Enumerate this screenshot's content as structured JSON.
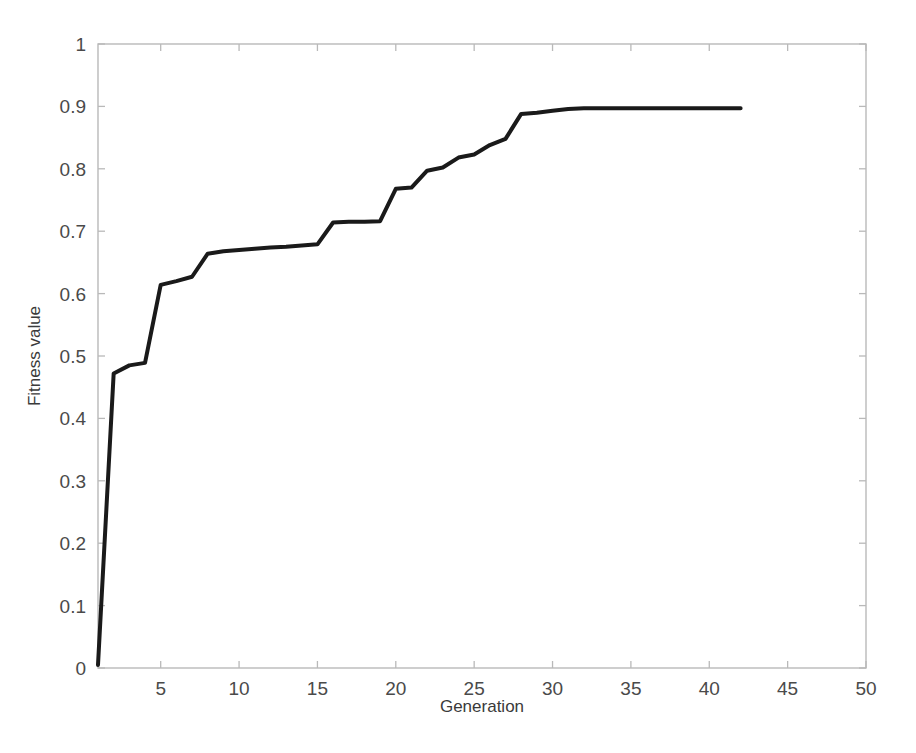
{
  "figure": {
    "background_color": "#ffffff",
    "line_color": "#1a1a1a",
    "axis_color": "#b9b9b9",
    "text_color": "#4a4a4a"
  },
  "chart_data": {
    "type": "line",
    "title": "",
    "subtitle": "",
    "xlabel": "Generation",
    "ylabel": "Fitness value",
    "xlim": [
      1,
      50
    ],
    "ylim": [
      0,
      1
    ],
    "grid": false,
    "legend": null,
    "x_ticks": [
      5,
      10,
      15,
      20,
      25,
      30,
      35,
      40,
      45,
      50
    ],
    "x_tick_labels": [
      "5",
      "10",
      "15",
      "20",
      "25",
      "30",
      "35",
      "40",
      "45",
      "50"
    ],
    "y_ticks": [
      0,
      0.1,
      0.2,
      0.3,
      0.4,
      0.5,
      0.6,
      0.7,
      0.8,
      0.9,
      1
    ],
    "y_tick_labels": [
      "0",
      "0.1",
      "0.2",
      "0.3",
      "0.4",
      "0.5",
      "0.6",
      "0.7",
      "0.8",
      "0.9",
      "1"
    ],
    "series": [
      {
        "name": "Best fitness",
        "line_width": 4,
        "color": "#1a1a1a",
        "x": [
          1,
          2,
          3,
          4,
          5,
          6,
          7,
          8,
          9,
          10,
          11,
          12,
          13,
          14,
          15,
          16,
          17,
          18,
          19,
          20,
          21,
          22,
          23,
          24,
          25,
          26,
          27,
          28,
          29,
          30,
          31,
          32,
          33,
          34,
          35,
          36,
          37,
          38,
          39,
          40,
          41,
          42
        ],
        "y": [
          0.005,
          0.472,
          0.485,
          0.489,
          0.614,
          0.62,
          0.627,
          0.664,
          0.668,
          0.67,
          0.672,
          0.674,
          0.675,
          0.677,
          0.679,
          0.714,
          0.715,
          0.715,
          0.716,
          0.768,
          0.77,
          0.797,
          0.802,
          0.818,
          0.823,
          0.838,
          0.848,
          0.888,
          0.89,
          0.893,
          0.896,
          0.897,
          0.897,
          0.897,
          0.897,
          0.897,
          0.897,
          0.897,
          0.897,
          0.897,
          0.897,
          0.897
        ]
      }
    ],
    "annotations": []
  }
}
